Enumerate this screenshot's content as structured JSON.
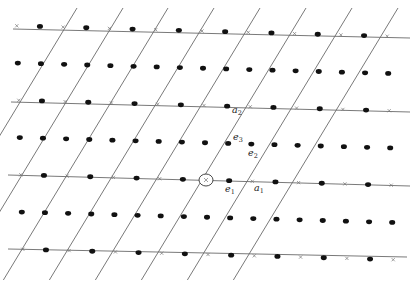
{
  "figure": {
    "labels": {
      "a1": {
        "base": "a",
        "sub": "1"
      },
      "a2": {
        "base": "a",
        "sub": "2"
      },
      "e1": {
        "base": "e",
        "sub": "1"
      },
      "e2": {
        "base": "e",
        "sub": "2"
      },
      "e3": {
        "base": "e",
        "sub": "3"
      }
    },
    "origin_marker": "×",
    "colors": {
      "line": "#6a6a6a",
      "dot": "#111111",
      "background": "#ffffff"
    }
  },
  "geometry": {
    "origin": [
      206,
      180
    ],
    "a1": [
      46.3,
      1.3
    ],
    "a2": [
      44.3,
      -73.2
    ],
    "horizontal_lines": [
      {
        "x1": 13,
        "y1": 29,
        "x2": 410,
        "y2": 38
      },
      {
        "x1": 11,
        "y1": 102,
        "x2": 410,
        "y2": 112
      },
      {
        "x1": 8,
        "y1": 175,
        "x2": 410,
        "y2": 186
      },
      {
        "x1": 8,
        "y1": 249,
        "x2": 407,
        "y2": 257
      }
    ],
    "slanted_line_top_x": [
      77,
      123,
      168,
      214,
      260,
      306,
      352,
      398
    ],
    "slanted_line_top_y": 8,
    "slanted_line_bottom_y": 280
  }
}
